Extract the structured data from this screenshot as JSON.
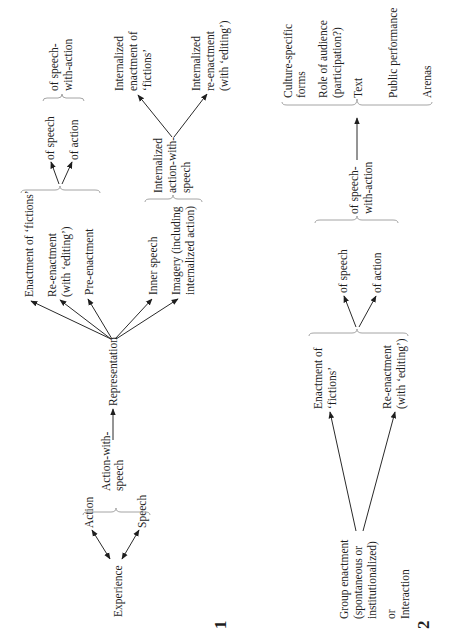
{
  "figure1": {
    "number": "1",
    "experience": "Experience",
    "action": "Action",
    "speech": "Speech",
    "action_with_speech": [
      "Action-with-",
      "speech"
    ],
    "representation": "Representation",
    "enactment_fictions": "Enactment of ‘fictions’",
    "re_enactment": [
      "Re-enactment",
      "(with ‘editing’)"
    ],
    "pre_enactment": "Pre-enactment",
    "inner_speech": "Inner speech",
    "imagery": [
      "Imagery (including",
      "internalized action)"
    ],
    "of_speech": "of speech",
    "of_action": "of action",
    "of_speech_with_action": [
      "of speech-",
      "with-action"
    ],
    "internalized_action_with_speech": [
      "Internalized",
      "action-with-",
      "speech"
    ],
    "internalized_enactment": [
      "Internalized",
      "enactment of",
      "‘fictions’"
    ],
    "internalized_re_enactment": [
      "Internalized",
      "re-enactment",
      "(with ‘editing’)"
    ]
  },
  "figure2": {
    "number": "2",
    "group_enactment": [
      "Group enactment",
      "(spontaneous or",
      "institutionalized)"
    ],
    "or": "or",
    "interaction": "Interaction",
    "enactment_fictions": [
      "Enactment of",
      "‘fictions’"
    ],
    "re_enactment": [
      "Re-enactment",
      "(with ‘editing’)"
    ],
    "of_speech": "of speech",
    "of_action": "of action",
    "of_speech_with_action": [
      "of speech-",
      "with-action"
    ],
    "outcomes": {
      "culture_specific": [
        "Culture-specific",
        "forms"
      ],
      "role_of_audience": [
        "Role of audience",
        "(participation?)"
      ],
      "text": "Text",
      "public_performance": "Public performance",
      "arenas": "Arenas"
    }
  }
}
